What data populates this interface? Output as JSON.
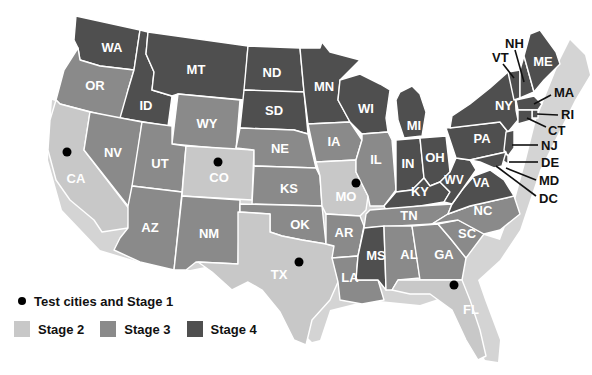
{
  "colors": {
    "stage2": "#c8c8c8",
    "stage3": "#8a8a8a",
    "stage4": "#4f4f4f",
    "dot": "#000000",
    "background": "#ffffff"
  },
  "legend": {
    "test_cities": "Test cities and Stage 1",
    "stage2": "Stage 2",
    "stage3": "Stage 3",
    "stage4": "Stage 4"
  },
  "states": {
    "WA": {
      "label": "WA",
      "stage": 4
    },
    "OR": {
      "label": "OR",
      "stage": 3
    },
    "CA": {
      "label": "CA",
      "stage": 2
    },
    "ID": {
      "label": "ID",
      "stage": 4
    },
    "NV": {
      "label": "NV",
      "stage": 3
    },
    "MT": {
      "label": "MT",
      "stage": 4
    },
    "WY": {
      "label": "WY",
      "stage": 3
    },
    "UT": {
      "label": "UT",
      "stage": 3
    },
    "AZ": {
      "label": "AZ",
      "stage": 3
    },
    "CO": {
      "label": "CO",
      "stage": 2
    },
    "NM": {
      "label": "NM",
      "stage": 3
    },
    "ND": {
      "label": "ND",
      "stage": 4
    },
    "SD": {
      "label": "SD",
      "stage": 4
    },
    "NE": {
      "label": "NE",
      "stage": 3
    },
    "KS": {
      "label": "KS",
      "stage": 3
    },
    "OK": {
      "label": "OK",
      "stage": 3
    },
    "TX": {
      "label": "TX",
      "stage": 2
    },
    "MN": {
      "label": "MN",
      "stage": 4
    },
    "IA": {
      "label": "IA",
      "stage": 3
    },
    "MO": {
      "label": "MO",
      "stage": 2
    },
    "AR": {
      "label": "AR",
      "stage": 3
    },
    "LA": {
      "label": "LA",
      "stage": 3
    },
    "WI": {
      "label": "WI",
      "stage": 4
    },
    "IL": {
      "label": "IL",
      "stage": 3
    },
    "MI": {
      "label": "MI",
      "stage": 4
    },
    "IN": {
      "label": "IN",
      "stage": 4
    },
    "OH": {
      "label": "OH",
      "stage": 4
    },
    "KY": {
      "label": "KY",
      "stage": 4
    },
    "TN": {
      "label": "TN",
      "stage": 3
    },
    "MS": {
      "label": "MS",
      "stage": 4
    },
    "AL": {
      "label": "AL",
      "stage": 3
    },
    "GA": {
      "label": "GA",
      "stage": 3
    },
    "FL": {
      "label": "FL",
      "stage": 2
    },
    "SC": {
      "label": "SC",
      "stage": 3
    },
    "NC": {
      "label": "NC",
      "stage": 3
    },
    "VA": {
      "label": "VA",
      "stage": 4
    },
    "WV": {
      "label": "WV",
      "stage": 4
    },
    "PA": {
      "label": "PA",
      "stage": 4
    },
    "NY": {
      "label": "NY",
      "stage": 4
    },
    "VT": {
      "label": "VT",
      "stage": 4
    },
    "NH": {
      "label": "NH",
      "stage": 4
    },
    "ME": {
      "label": "ME",
      "stage": 4
    },
    "MA": {
      "label": "MA",
      "stage": 4
    },
    "RI": {
      "label": "RI",
      "stage": 4
    },
    "CT": {
      "label": "CT",
      "stage": 4
    },
    "NJ": {
      "label": "NJ",
      "stage": 4
    },
    "DE": {
      "label": "DE",
      "stage": 4
    },
    "MD": {
      "label": "MD",
      "stage": 4
    },
    "DC": {
      "label": "DC",
      "stage": 4
    }
  },
  "test_cities": [
    {
      "state": "CA",
      "x": 67,
      "y": 152
    },
    {
      "state": "CO",
      "x": 218,
      "y": 162
    },
    {
      "state": "MO",
      "x": 356,
      "y": 183
    },
    {
      "state": "TX",
      "x": 299,
      "y": 262
    },
    {
      "state": "FL",
      "x": 454,
      "y": 285
    }
  ]
}
